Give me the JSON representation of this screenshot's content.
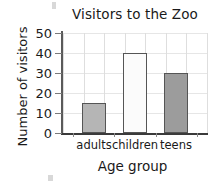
{
  "chart_data": {
    "type": "bar",
    "title": "Visitors to the Zoo",
    "xlabel": "Age group",
    "ylabel": "Number of visitors",
    "categories": [
      "adults",
      "children",
      "teens"
    ],
    "values": [
      15,
      40,
      30
    ],
    "ylim": [
      0,
      50
    ],
    "ytick_labels": [
      "0",
      "10",
      "20",
      "30",
      "40",
      "50"
    ],
    "ytick_values": [
      0,
      10,
      20,
      30,
      40,
      50
    ],
    "grid": true,
    "legend": "none",
    "bar_colors": [
      "#b5b5b5",
      "#fbfbfb",
      "#9c9c9c"
    ],
    "bar_edge_color": "#555555",
    "axis_color": "#3a3a3a",
    "grid_color": "#dedede",
    "text_color": "#1a1a1a",
    "background": "#ffffff"
  }
}
